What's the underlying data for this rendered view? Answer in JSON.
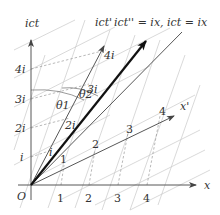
{
  "diagram": {
    "title_labels": {
      "ict_axis": "ict",
      "ict_prime_axis": "ict'",
      "ict_double_prime": "ict'' = ix, ict = ix",
      "x_axis": "x",
      "x_prime_axis": "x'",
      "origin": "O"
    },
    "ict_axis_ticks": [
      "i",
      "2i",
      "3i",
      "4i"
    ],
    "ict_prime_ticks": [
      "i",
      "2i",
      "3i",
      "4i"
    ],
    "x_axis_ticks": [
      "1",
      "2",
      "3",
      "4"
    ],
    "x_prime_ticks": [
      "1",
      "2",
      "3",
      "4"
    ],
    "angles": [
      "θ1",
      "θ2"
    ],
    "colors": {
      "axis": "#444444",
      "bold_vector": "#111111",
      "grid": "#c8c8c8",
      "dashed": "#8a8a8a",
      "text": "#333333"
    }
  }
}
